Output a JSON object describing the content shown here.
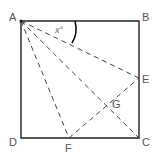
{
  "figure": {
    "type": "geometry-square",
    "labels": {
      "A": "A",
      "B": "B",
      "C": "C",
      "D": "D",
      "E": "E",
      "F": "F",
      "G": "G"
    },
    "angle_label": "x°",
    "colors": {
      "line": "#222222",
      "dashed": "#444444",
      "label": "#555555"
    }
  }
}
